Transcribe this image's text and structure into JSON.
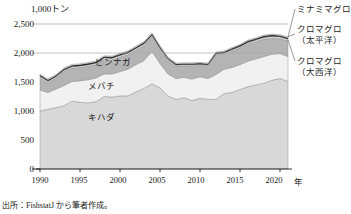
{
  "chart_data": {
    "type": "area",
    "stacked": true,
    "title": "",
    "subtitle": "",
    "unit_label": "1,000トン",
    "xlabel": "年",
    "ylabel": "",
    "ylim": [
      0,
      2500
    ],
    "xlim": [
      1990,
      2021
    ],
    "grid": "horizontal-gridlines-at-2000-and-2500",
    "legend_position": "right-callout-and-inline",
    "yticks": [
      "0",
      "500",
      "1,000",
      "1,500",
      "2,000",
      "2,500"
    ],
    "ytick_values": [
      0,
      500,
      1000,
      1500,
      2000,
      2500
    ],
    "xticks": [
      "1990",
      "1995",
      "2000",
      "2005",
      "2010",
      "2015",
      "2020"
    ],
    "xtick_values": [
      1990,
      1995,
      2000,
      2005,
      2010,
      2015,
      2020
    ],
    "x": [
      1990,
      1991,
      1992,
      1993,
      1994,
      1995,
      1996,
      1997,
      1998,
      1999,
      2000,
      2001,
      2002,
      2003,
      2004,
      2005,
      2006,
      2007,
      2008,
      2009,
      2010,
      2011,
      2012,
      2013,
      2014,
      2015,
      2016,
      2017,
      2018,
      2019,
      2020,
      2021
    ],
    "series": [
      {
        "name": "キハダ",
        "label_inline": "キハダ",
        "color": "#d8d8d8",
        "values": [
          1000,
          1030,
          1060,
          1090,
          1170,
          1150,
          1140,
          1160,
          1250,
          1240,
          1260,
          1260,
          1330,
          1390,
          1470,
          1400,
          1260,
          1200,
          1230,
          1180,
          1220,
          1200,
          1200,
          1300,
          1320,
          1370,
          1420,
          1450,
          1480,
          1530,
          1560,
          1510
        ]
      },
      {
        "name": "メバチ",
        "label_inline": "メバチ",
        "color": "#f1f1f1",
        "values": [
          360,
          290,
          320,
          350,
          340,
          370,
          400,
          410,
          390,
          400,
          420,
          460,
          470,
          480,
          560,
          420,
          380,
          360,
          350,
          370,
          370,
          360,
          430,
          420,
          430,
          430,
          440,
          450,
          460,
          450,
          430,
          430
        ]
      },
      {
        "name": "ビンナガ",
        "label_inline": "ビンナガ",
        "color": "#b4b4b4",
        "values": [
          210,
          170,
          190,
          240,
          230,
          230,
          230,
          230,
          250,
          240,
          250,
          250,
          250,
          260,
          250,
          240,
          230,
          210,
          200,
          230,
          200,
          220,
          340,
          260,
          290,
          290,
          300,
          300,
          300,
          280,
          260,
          270
        ]
      },
      {
        "name": "クロマグロ（大西洋）",
        "label_callout": "クロマグロ\n（大西洋）",
        "color": "#e8e8e8",
        "values": [
          28,
          26,
          25,
          26,
          26,
          28,
          28,
          27,
          28,
          30,
          30,
          30,
          30,
          30,
          28,
          28,
          25,
          24,
          22,
          20,
          18,
          18,
          18,
          20,
          22,
          24,
          26,
          28,
          30,
          30,
          30,
          30
        ]
      },
      {
        "name": "クロマグロ（太平洋）",
        "label_callout": "クロマグロ\n（太平洋）",
        "color": "#2b2b2b",
        "values": [
          22,
          22,
          22,
          24,
          24,
          24,
          24,
          22,
          22,
          24,
          24,
          24,
          24,
          26,
          24,
          22,
          20,
          20,
          18,
          18,
          18,
          18,
          20,
          20,
          22,
          22,
          24,
          24,
          26,
          24,
          22,
          22
        ]
      },
      {
        "name": "ミナミマグロ",
        "label_callout": "ミナミマグロ",
        "color": "#fafafa",
        "values": [
          14,
          14,
          14,
          14,
          14,
          14,
          14,
          14,
          14,
          14,
          14,
          14,
          14,
          14,
          14,
          14,
          14,
          14,
          14,
          14,
          12,
          12,
          12,
          12,
          12,
          12,
          14,
          14,
          14,
          14,
          14,
          14
        ]
      }
    ],
    "source_note": "出所：FishstatJ から筆者作成。"
  },
  "axis": {
    "unit_label": "1,000トン",
    "x_unit": "年",
    "yticks": [
      {
        "label": "2,500"
      },
      {
        "label": "2,000"
      },
      {
        "label": "1,500"
      },
      {
        "label": "1,000"
      },
      {
        "label": "500"
      },
      {
        "label": "0"
      }
    ],
    "xticks": [
      {
        "label": "1990"
      },
      {
        "label": "1995"
      },
      {
        "label": "2000"
      },
      {
        "label": "2005"
      },
      {
        "label": "2010"
      },
      {
        "label": "2015"
      },
      {
        "label": "2020"
      }
    ]
  },
  "inline_labels": {
    "binnaga": "ビンナガ",
    "mebachi": "メバチ",
    "kihada": "キハダ"
  },
  "callouts": {
    "minami": "ミナミマグロ",
    "kuro_pacific_line1": "クロマグロ",
    "kuro_pacific_line2": "（太平洋）",
    "kuro_atlantic_line1": "クロマグロ",
    "kuro_atlantic_line2": "（大西洋）"
  },
  "footer": {
    "source": "出所：FishstatJ から筆者作成。"
  },
  "colors": {
    "kihada": "#d8d8d8",
    "mebachi": "#f1f1f1",
    "binnaga": "#b4b4b4",
    "kuro_atlantic": "#e8e8e8",
    "kuro_pacific": "#2b2b2b",
    "minami": "#fafafa",
    "axis": "#000000",
    "gridline": "#aaaaaa"
  }
}
